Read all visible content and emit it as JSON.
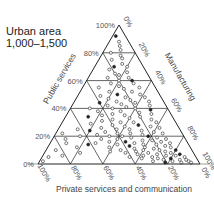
{
  "title": {
    "line1": "Urban area",
    "line2": "1,000–1,500"
  },
  "chart_data": {
    "type": "scatter",
    "subtype": "ternary",
    "title": "Urban area 1,000–1,500",
    "axes": {
      "left": {
        "label": "Public services",
        "ticks": [
          "0%",
          "20%",
          "40%",
          "60%",
          "80%",
          "100%"
        ]
      },
      "right": {
        "label": "Manufacturing",
        "ticks": [
          "0%",
          "20%",
          "40%",
          "60%",
          "80%",
          "100%"
        ]
      },
      "bottom": {
        "label": "Private services and communication",
        "ticks": [
          "100%",
          "80%",
          "60%",
          "40%",
          "20%",
          "0%"
        ]
      }
    },
    "grid": true,
    "grid_step": 20,
    "points_note": "approximate [public, manufacturing] percent; private = 100 - public - manufacturing",
    "points": [
      [
        92,
        2
      ],
      [
        88,
        6
      ],
      [
        85,
        8
      ],
      [
        82,
        10
      ],
      [
        80,
        5
      ],
      [
        78,
        12
      ],
      [
        76,
        14
      ],
      [
        75,
        8
      ],
      [
        72,
        16
      ],
      [
        70,
        12
      ],
      [
        70,
        20
      ],
      [
        68,
        10
      ],
      [
        66,
        22
      ],
      [
        65,
        15
      ],
      [
        64,
        18
      ],
      [
        62,
        25
      ],
      [
        62,
        12
      ],
      [
        60,
        20
      ],
      [
        60,
        28
      ],
      [
        58,
        16
      ],
      [
        58,
        30
      ],
      [
        56,
        22
      ],
      [
        55,
        35
      ],
      [
        55,
        10
      ],
      [
        54,
        26
      ],
      [
        52,
        32
      ],
      [
        52,
        18
      ],
      [
        50,
        24
      ],
      [
        50,
        38
      ],
      [
        49,
        14
      ],
      [
        48,
        30
      ],
      [
        48,
        42
      ],
      [
        47,
        20
      ],
      [
        46,
        34
      ],
      [
        45,
        26
      ],
      [
        45,
        46
      ],
      [
        44,
        16
      ],
      [
        44,
        38
      ],
      [
        43,
        30
      ],
      [
        42,
        22
      ],
      [
        42,
        48
      ],
      [
        41,
        34
      ],
      [
        40,
        12
      ],
      [
        40,
        40
      ],
      [
        40,
        26
      ],
      [
        39,
        50
      ],
      [
        38,
        32
      ],
      [
        38,
        18
      ],
      [
        37,
        44
      ],
      [
        36,
        28
      ],
      [
        36,
        52
      ],
      [
        35,
        36
      ],
      [
        35,
        22
      ],
      [
        34,
        46
      ],
      [
        34,
        14
      ],
      [
        33,
        40
      ],
      [
        32,
        30
      ],
      [
        32,
        54
      ],
      [
        31,
        24
      ],
      [
        30,
        44
      ],
      [
        30,
        36
      ],
      [
        30,
        58
      ],
      [
        29,
        18
      ],
      [
        28,
        48
      ],
      [
        28,
        32
      ],
      [
        27,
        40
      ],
      [
        27,
        56
      ],
      [
        26,
        26
      ],
      [
        26,
        62
      ],
      [
        25,
        44
      ],
      [
        25,
        36
      ],
      [
        24,
        52
      ],
      [
        24,
        20
      ],
      [
        23,
        60
      ],
      [
        23,
        30
      ],
      [
        22,
        46
      ],
      [
        22,
        38
      ],
      [
        22,
        66
      ],
      [
        21,
        54
      ],
      [
        21,
        26
      ],
      [
        20,
        42
      ],
      [
        20,
        58
      ],
      [
        20,
        34
      ],
      [
        19,
        64
      ],
      [
        19,
        48
      ],
      [
        18,
        30
      ],
      [
        18,
        70
      ],
      [
        18,
        40
      ],
      [
        17,
        56
      ],
      [
        17,
        62
      ],
      [
        16,
        46
      ],
      [
        16,
        36
      ],
      [
        16,
        68
      ],
      [
        15,
        52
      ],
      [
        15,
        74
      ],
      [
        15,
        28
      ],
      [
        14,
        58
      ],
      [
        14,
        42
      ],
      [
        14,
        66
      ],
      [
        13,
        50
      ],
      [
        13,
        72
      ],
      [
        12,
        60
      ],
      [
        12,
        38
      ],
      [
        12,
        76
      ],
      [
        11,
        54
      ],
      [
        11,
        66
      ],
      [
        10,
        46
      ],
      [
        10,
        70
      ],
      [
        10,
        80
      ],
      [
        10,
        60
      ],
      [
        9,
        56
      ],
      [
        9,
        74
      ],
      [
        9,
        40
      ],
      [
        8,
        64
      ],
      [
        8,
        78
      ],
      [
        8,
        50
      ],
      [
        7,
        70
      ],
      [
        7,
        84
      ],
      [
        7,
        58
      ],
      [
        6,
        62
      ],
      [
        6,
        76
      ],
      [
        6,
        82
      ],
      [
        5,
        68
      ],
      [
        5,
        88
      ],
      [
        5,
        54
      ],
      [
        4,
        72
      ],
      [
        4,
        80
      ],
      [
        4,
        62
      ],
      [
        3,
        76
      ],
      [
        3,
        86
      ],
      [
        3,
        90
      ],
      [
        2,
        82
      ],
      [
        2,
        70
      ],
      [
        2,
        92
      ],
      [
        1,
        88
      ],
      [
        1,
        78
      ],
      [
        1,
        94
      ],
      [
        15,
        10
      ],
      [
        12,
        18
      ],
      [
        10,
        6
      ],
      [
        8,
        22
      ],
      [
        6,
        12
      ],
      [
        18,
        8
      ],
      [
        20,
        16
      ],
      [
        14,
        24
      ],
      [
        25,
        12
      ],
      [
        5,
        4
      ],
      [
        2,
        2
      ],
      [
        22,
        4
      ]
    ]
  }
}
